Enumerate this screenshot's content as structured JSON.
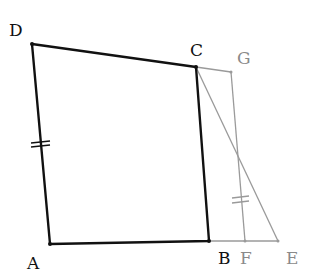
{
  "diagram": {
    "type": "geometry",
    "points": {
      "A": {
        "label": "A",
        "x": 50,
        "y": 244
      },
      "B": {
        "label": "B",
        "x": 209,
        "y": 241
      },
      "C": {
        "label": "C",
        "x": 196,
        "y": 67
      },
      "D": {
        "label": "D",
        "x": 32,
        "y": 44
      },
      "E": {
        "label": "E",
        "x": 278,
        "y": 241
      },
      "F": {
        "label": "F",
        "x": 245,
        "y": 241
      },
      "G": {
        "label": "G",
        "x": 231,
        "y": 72
      }
    },
    "quadrilateral": [
      "A",
      "B",
      "C",
      "D"
    ],
    "auxiliary_segments": [
      [
        "C",
        "G"
      ],
      [
        "G",
        "F"
      ],
      [
        "C",
        "E"
      ],
      [
        "B",
        "E"
      ]
    ],
    "equal_marks": [
      [
        "A",
        "D"
      ],
      [
        "G",
        "F"
      ]
    ],
    "colors": {
      "main": "#111111",
      "auxiliary": "#999999"
    }
  }
}
